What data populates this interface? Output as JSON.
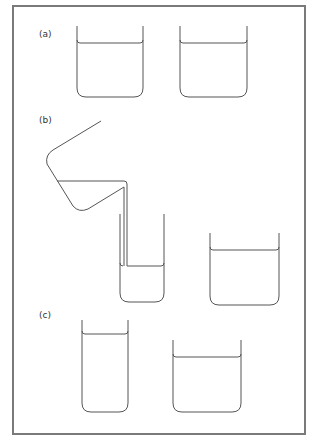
{
  "figure": {
    "panels": [
      {
        "id": "a",
        "label": "(a)",
        "description": "Two identical beakers containing equal amounts of water at the same level",
        "beakers": [
          {
            "name": "beaker-a-left",
            "x1": 77,
            "x2": 143,
            "top": 26,
            "water": 43,
            "bottom": 97
          },
          {
            "name": "beaker-a-right",
            "x1": 180,
            "x2": 247,
            "top": 26,
            "water": 43,
            "bottom": 97
          }
        ]
      },
      {
        "id": "b",
        "label": "(b)",
        "description": "Water from one beaker being poured into a tall narrow beaker; the other wide beaker remains",
        "beakers": [
          {
            "name": "beaker-b-narrow",
            "x1": 120,
            "x2": 164,
            "top": 214,
            "water": 266,
            "bottom": 302
          },
          {
            "name": "beaker-b-wide",
            "x1": 210,
            "x2": 279,
            "top": 233,
            "water": 250,
            "bottom": 305
          }
        ]
      },
      {
        "id": "c",
        "label": "(c)",
        "description": "Tall narrow beaker with a higher water level beside a wide beaker with a lower level",
        "beakers": [
          {
            "name": "beaker-c-narrow",
            "x1": 82,
            "x2": 128,
            "top": 320,
            "water": 334,
            "bottom": 412
          },
          {
            "name": "beaker-c-wide",
            "x1": 173,
            "x2": 241,
            "top": 340,
            "water": 357,
            "bottom": 412
          }
        ]
      }
    ],
    "colors": {
      "frame": "#7a7a7a",
      "line": "#555555",
      "background": "#ffffff"
    }
  }
}
